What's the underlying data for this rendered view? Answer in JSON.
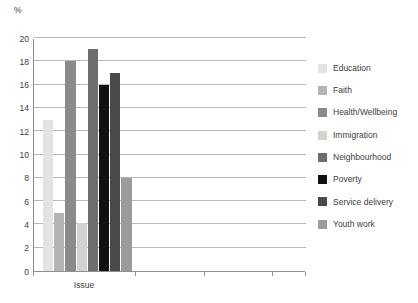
{
  "chart_data": {
    "type": "bar",
    "title": "",
    "subtitle": "",
    "xlabel": "",
    "ylabel": "%",
    "categories": [
      "Issue"
    ],
    "ylim": [
      0,
      20
    ],
    "ytick_values": [
      20,
      18,
      16,
      14,
      12,
      10,
      8,
      6,
      4,
      2,
      0
    ],
    "ytick_labels": [
      "20",
      "18",
      "16",
      "14",
      "12",
      "10",
      "8",
      "6",
      "4",
      "2",
      "0"
    ],
    "grid": true,
    "legend_position": "right",
    "series": [
      {
        "name": "Education",
        "values": [
          13.0
        ],
        "color": "#e3e3e3"
      },
      {
        "name": "Faith",
        "values": [
          5.0
        ],
        "color": "#b4b4b4"
      },
      {
        "name": "Health/Wellbeing",
        "values": [
          18.0
        ],
        "color": "#8a8a8a"
      },
      {
        "name": "Immigration",
        "values": [
          4.1
        ],
        "color": "#d2d2d2"
      },
      {
        "name": "Neighbourhood",
        "values": [
          19.1
        ],
        "color": "#6e6e6e"
      },
      {
        "name": "Poverty",
        "values": [
          16.0
        ],
        "color": "#111111"
      },
      {
        "name": "Service delivery",
        "values": [
          17.0
        ],
        "color": "#4a4a4a"
      },
      {
        "name": "Youth work",
        "values": [
          8.0
        ],
        "color": "#9b9b9b"
      }
    ]
  },
  "axis": {
    "y_unit_label": "%",
    "category_label": "Issue"
  },
  "legend": {
    "items": [
      {
        "label": "Education",
        "color": "#e3e3e3"
      },
      {
        "label": "Faith",
        "color": "#b4b4b4"
      },
      {
        "label": "Health/Wellbeing",
        "color": "#8a8a8a"
      },
      {
        "label": "Immigration",
        "color": "#d2d2d2"
      },
      {
        "label": "Neighbourhood",
        "color": "#6e6e6e"
      },
      {
        "label": "Poverty",
        "color": "#111111"
      },
      {
        "label": "Service delivery",
        "color": "#4a4a4a"
      },
      {
        "label": "Youth work",
        "color": "#9b9b9b"
      }
    ]
  },
  "colors": {
    "axis_line": "#8f8f8f",
    "gridline": "#b9b9b9",
    "text": "#3d3d3d",
    "background": "#ffffff"
  }
}
